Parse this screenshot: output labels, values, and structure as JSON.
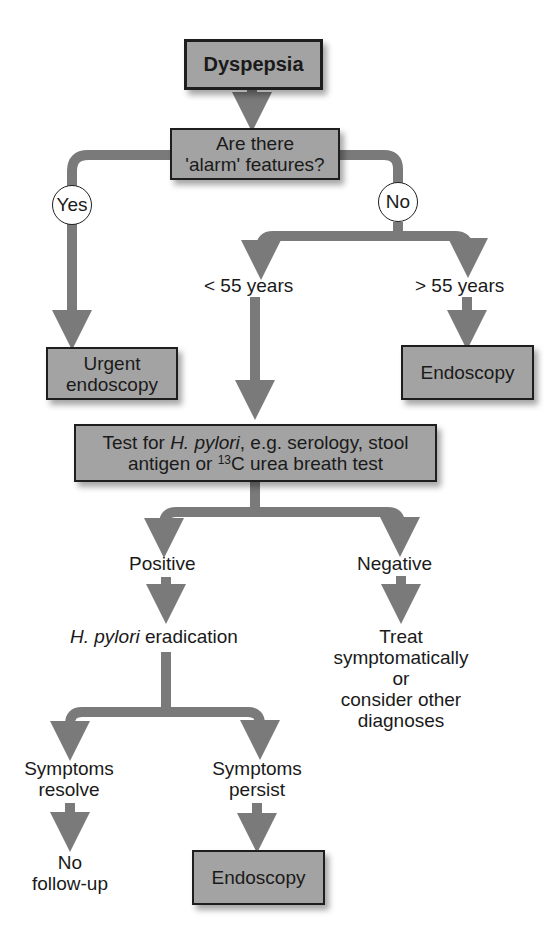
{
  "flowchart": {
    "start": "Dyspepsia",
    "question": {
      "line1": "Are there",
      "line2": "'alarm' features?"
    },
    "yes_label": "Yes",
    "no_label": "No",
    "urgent": {
      "line1": "Urgent",
      "line2": "endoscopy"
    },
    "under55": "< 55 years",
    "over55": "> 55 years",
    "endoscopy_top": "Endoscopy",
    "test": {
      "line1_pre": "Test for ",
      "line1_italic": "H. pylori",
      "line1_post": ", e.g. serology, stool",
      "line2_pre": "antigen or ",
      "line2_sup": "13",
      "line2_post": "C urea breath test"
    },
    "positive": "Positive",
    "negative": "Negative",
    "eradication": {
      "italic": "H. pylori",
      "rest": " eradication"
    },
    "treat": {
      "line1": "Treat",
      "line2": "symptomatically",
      "line3": "or",
      "line4": "consider other",
      "line5": "diagnoses"
    },
    "resolve": {
      "line1": "Symptoms",
      "line2": "resolve"
    },
    "persist": {
      "line1": "Symptoms",
      "line2": "persist"
    },
    "no_followup": {
      "line1": "No",
      "line2": "follow-up"
    },
    "endoscopy_bottom": "Endoscopy"
  },
  "colors": {
    "box_fill": "#a3a3a3",
    "arrow": "#7a7a7a",
    "border": "#1e1e1e"
  }
}
